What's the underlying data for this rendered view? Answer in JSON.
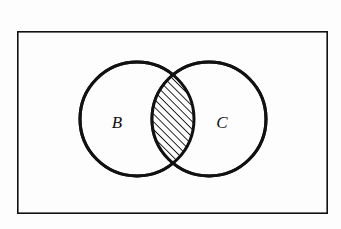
{
  "figure": {
    "type": "venn-diagram",
    "background_color": "#fdfdfd",
    "ink_color": "#111111"
  },
  "universe": {
    "name": "universal-set-rectangle",
    "label": "",
    "x": 17,
    "y": 31,
    "width": 311,
    "height": 183,
    "stroke_width": 1.6,
    "stroke_color": "#111111",
    "fill_color": "#fdfdfd"
  },
  "sets": [
    {
      "id": "B",
      "label": "B",
      "name": "set-circle-b",
      "cx": 137,
      "cy": 119,
      "r": 57,
      "label_x": 117,
      "label_y": 124,
      "stroke_width": 3,
      "stroke_color": "#111111",
      "fill_color": "#fdfdfd"
    },
    {
      "id": "C",
      "label": "C",
      "name": "set-circle-c",
      "cx": 209,
      "cy": 119,
      "r": 57,
      "label_x": 222,
      "label_y": 124,
      "stroke_width": 3,
      "stroke_color": "#111111",
      "fill_color": "#fdfdfd"
    }
  ],
  "intersection": {
    "name": "intersection-lens",
    "notation": "B ∩ C",
    "shading": "diagonal-hatch",
    "hatch_direction": "/",
    "hatch_angle_deg": 45,
    "hatch_spacing_px": 5.5,
    "hatch_stroke_width": 1.8,
    "hatch_color": "#111111",
    "top_point_x": 173,
    "top_point_y": 73,
    "bottom_point_x": 173,
    "bottom_point_y": 168,
    "outline_stroke_width": 3
  }
}
